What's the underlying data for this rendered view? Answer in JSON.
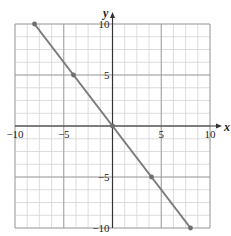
{
  "chart_data": {
    "type": "line",
    "title": "",
    "xlabel": "x",
    "ylabel": "y",
    "xlim": [
      -10,
      10
    ],
    "ylim": [
      -10,
      10
    ],
    "grid": true,
    "minor_grid_step": 1.25,
    "major_grid_step": 5,
    "x_ticks": [
      -10,
      -5,
      5,
      10
    ],
    "y_ticks": [
      -10,
      -5,
      5,
      10
    ],
    "x_tick_labels": [
      "−10",
      "−5",
      "5",
      "10"
    ],
    "y_tick_labels": [
      "−10",
      "−5",
      "5",
      "10"
    ],
    "series": [
      {
        "name": "y = -1.25x",
        "x": [
          -8,
          -4,
          0,
          4,
          8
        ],
        "y": [
          10,
          5,
          0,
          -5,
          -10
        ],
        "color": "#7a7a7a",
        "markers": true
      }
    ],
    "legend": null
  },
  "colors": {
    "minor_grid": "#d4d4d4",
    "major_grid": "#9a9a9a",
    "axis": "#333333",
    "line": "#7a7a7a",
    "marker": "#6e6e6e"
  }
}
